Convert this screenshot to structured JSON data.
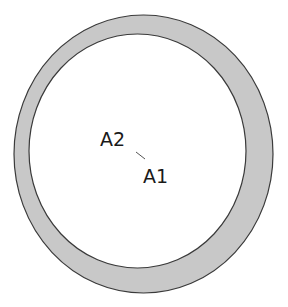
{
  "diagram": {
    "type": "eccentric-circles",
    "outer_circle": {
      "cx": 143.5,
      "cy": 154,
      "rx": 129.5,
      "ry": 139,
      "fill": "#c8c8c8",
      "stroke": "#3a3a3a"
    },
    "inner_circle": {
      "cx": 137.5,
      "cy": 151,
      "rx": 108.5,
      "ry": 117,
      "fill": "#ffffff",
      "stroke": "#3a3a3a"
    },
    "labels": [
      {
        "id": "A2",
        "text": "A2",
        "x": 100,
        "y": 146
      },
      {
        "id": "A1",
        "text": "A1",
        "x": 143,
        "y": 183
      }
    ],
    "connector": {
      "x1": 136,
      "y1": 152,
      "x2": 145,
      "y2": 159,
      "stroke": "#555555"
    }
  }
}
